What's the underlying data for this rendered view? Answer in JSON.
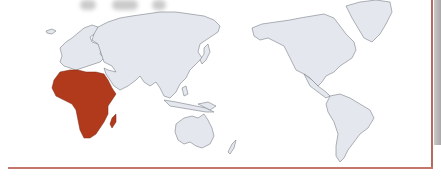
{
  "map": {
    "projection": "world map centered on Pacific (Africa left, Americas right)",
    "highlighted_region": "Africa",
    "colors": {
      "highlight": "#b23a1c",
      "land": "#e4e8ee",
      "coastline": "#7a7f86",
      "background": "#ffffff",
      "frame_border": "#c3766a",
      "shadow": "#b0b0b0"
    },
    "regions": [
      {
        "name": "Europe",
        "highlighted": false
      },
      {
        "name": "Asia",
        "highlighted": false
      },
      {
        "name": "Africa",
        "highlighted": true
      },
      {
        "name": "Madagascar",
        "highlighted": true
      },
      {
        "name": "Australia",
        "highlighted": false
      },
      {
        "name": "New Zealand",
        "highlighted": false
      },
      {
        "name": "North America",
        "highlighted": false
      },
      {
        "name": "Greenland",
        "highlighted": false
      },
      {
        "name": "South America",
        "highlighted": false
      }
    ]
  }
}
